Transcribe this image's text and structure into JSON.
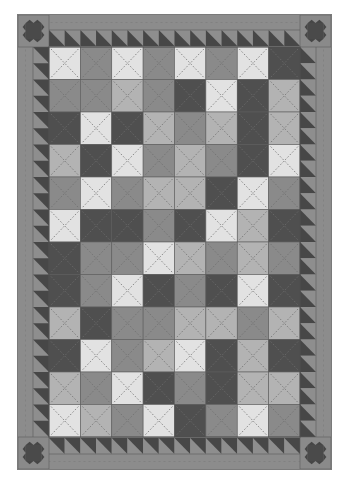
{
  "image": {
    "subject": "Quilt layout (grayscale)",
    "background": "#ffffff"
  },
  "quilt": {
    "outer_border_color": "#8c8c8c",
    "sawtooth": {
      "dark": "#474747",
      "light": "#8e8e8e",
      "count_horizontal": 16,
      "count_vertical": 24
    },
    "corner_star": {
      "background": "#8a8a8a",
      "star": "#464646",
      "center": "#4a4a4a"
    },
    "stitch_color": "#6e6e6e",
    "palette": {
      "L": "#e2e2e2",
      "LM": "#b3b3b3",
      "M": "#8a8a8a",
      "D": "#4f4f4f"
    },
    "grid": {
      "columns": 8,
      "rows": 12,
      "cells": [
        [
          "L",
          "M",
          "L",
          "M",
          "L",
          "M",
          "L",
          "D"
        ],
        [
          "M",
          "M",
          "LM",
          "M",
          "D",
          "L",
          "D",
          "LM"
        ],
        [
          "D",
          "L",
          "D",
          "LM",
          "M",
          "LM",
          "D",
          "LM"
        ],
        [
          "LM",
          "D",
          "L",
          "M",
          "LM",
          "M",
          "D",
          "L"
        ],
        [
          "M",
          "L",
          "M",
          "LM",
          "LM",
          "D",
          "L",
          "M"
        ],
        [
          "L",
          "D",
          "D",
          "M",
          "D",
          "L",
          "LM",
          "D"
        ],
        [
          "D",
          "M",
          "M",
          "L",
          "LM",
          "M",
          "LM",
          "M"
        ],
        [
          "D",
          "M",
          "L",
          "D",
          "M",
          "D",
          "L",
          "D"
        ],
        [
          "LM",
          "D",
          "M",
          "M",
          "LM",
          "LM",
          "M",
          "LM"
        ],
        [
          "D",
          "L",
          "M",
          "LM",
          "L",
          "D",
          "LM",
          "D"
        ],
        [
          "LM",
          "M",
          "L",
          "D",
          "M",
          "D",
          "LM",
          "LM"
        ],
        [
          "L",
          "LM",
          "M",
          "L",
          "D",
          "M",
          "L",
          "M"
        ]
      ]
    }
  }
}
